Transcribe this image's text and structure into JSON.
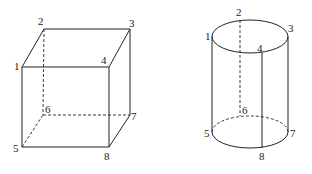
{
  "figures": [
    {
      "name": "cube",
      "vertex_labels": {
        "v1": "1",
        "v2": "2",
        "v3": "3",
        "v4": "4",
        "v5": "5",
        "v6": "6",
        "v7": "7",
        "v8": "8"
      },
      "edges_solid": [
        "1-2",
        "2-3",
        "3-4",
        "1-4",
        "1-5",
        "4-8",
        "5-8",
        "3-7",
        "7-8"
      ],
      "edges_hidden": [
        "2-6",
        "5-6",
        "6-7"
      ]
    },
    {
      "name": "cylinder",
      "point_labels": {
        "p1": "1",
        "p2": "2",
        "p3": "3",
        "p4": "4",
        "p5": "5",
        "p6": "6",
        "p7": "7",
        "p8": "8"
      },
      "lines_solid": [
        "1-5",
        "3-7",
        "4-8"
      ],
      "lines_hidden": [
        "2-6"
      ]
    }
  ],
  "colors": {
    "line": "#222222",
    "background": "#ffffff"
  }
}
